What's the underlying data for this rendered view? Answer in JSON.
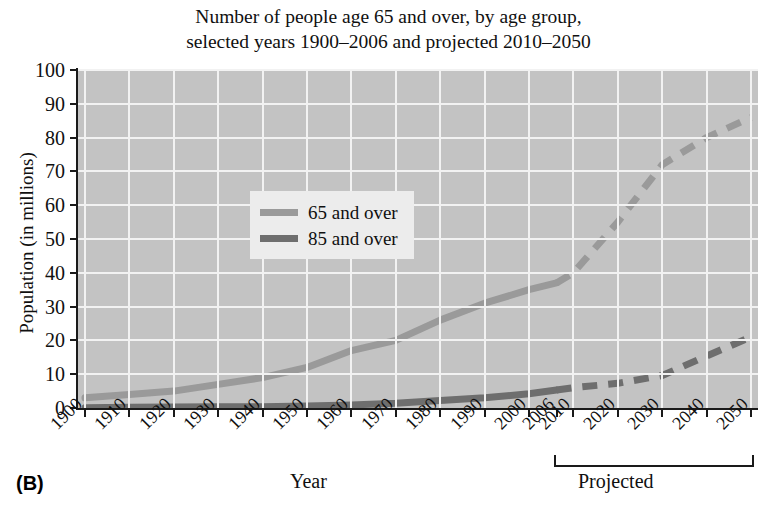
{
  "panel_label": "(B)",
  "title": {
    "line1": "Number of people age 65 and over, by age group,",
    "line2": "selected years 1900–2006 and projected 2010–2050"
  },
  "axes": {
    "ylabel": "Population (in millions)",
    "xlabel": "Year",
    "projected_label": "Projected"
  },
  "legend": {
    "items": [
      {
        "label": "65 and over",
        "color": "#9a9a9a"
      },
      {
        "label": "85 and over",
        "color": "#6e6e6e"
      }
    ]
  },
  "colors": {
    "plot_background": "#c3c3c3",
    "gridline": "#f2f2f2",
    "axis": "#1a1a1a",
    "series_65": "#9a9a9a",
    "series_85": "#6e6e6e",
    "page_background": "#ffffff"
  },
  "chart_data": {
    "type": "line",
    "title": "Number of people age 65 and over, by age group, selected years 1900–2006 and projected 2010–2050",
    "xlabel": "Year",
    "ylabel": "Population (in millions)",
    "ylim": [
      0,
      100
    ],
    "ytick_values": [
      0,
      10,
      20,
      30,
      40,
      50,
      60,
      70,
      80,
      90,
      100
    ],
    "xtick_labels": [
      "1900",
      "1910",
      "1920",
      "1930",
      "1940",
      "1950",
      "1960",
      "1970",
      "1980",
      "1990",
      "2000",
      "2006",
      "2010",
      "2020",
      "2030",
      "2040",
      "2050"
    ],
    "grid": true,
    "legend_position": "upper-left-inside",
    "projected_from": "2010",
    "annotations": [
      "Projected bracket spans 2010–2050"
    ],
    "series": [
      {
        "name": "65 and over",
        "color": "#9a9a9a",
        "historical": {
          "x": [
            "1900",
            "1910",
            "1920",
            "1930",
            "1940",
            "1950",
            "1960",
            "1970",
            "1980",
            "1990",
            "2000",
            "2006"
          ],
          "values": [
            3,
            4,
            5,
            7,
            9,
            12,
            17,
            20,
            26,
            31,
            35,
            37
          ]
        },
        "projected": {
          "x": [
            "2006",
            "2010",
            "2020",
            "2030",
            "2040",
            "2050"
          ],
          "values": [
            37,
            40,
            55,
            72,
            80,
            86
          ]
        }
      },
      {
        "name": "85 and over",
        "color": "#6e6e6e",
        "historical": {
          "x": [
            "1900",
            "1910",
            "1920",
            "1930",
            "1940",
            "1950",
            "1960",
            "1970",
            "1980",
            "1990",
            "2000",
            "2006"
          ],
          "values": [
            0.1,
            0.2,
            0.3,
            0.4,
            0.4,
            0.6,
            0.9,
            1.4,
            2.2,
            3.0,
            4.2,
            5.3
          ]
        },
        "projected": {
          "x": [
            "2006",
            "2010",
            "2020",
            "2030",
            "2040",
            "2050"
          ],
          "values": [
            5.3,
            6.0,
            7.3,
            9.6,
            15.4,
            21.0
          ]
        }
      }
    ]
  }
}
